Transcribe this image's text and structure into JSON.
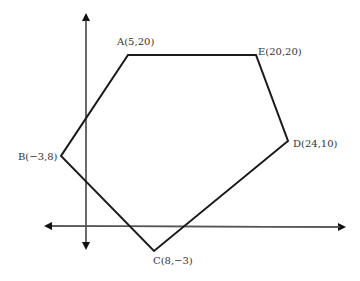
{
  "diagram": {
    "type": "coordinate-plane-polygon",
    "colors": {
      "axes": "#555555",
      "polygon": "#1a1a1a",
      "labels": "#333333"
    },
    "axes": {
      "x_axis": {
        "y": 226,
        "x_start": 44,
        "x_end": 346
      },
      "y_axis": {
        "x": 86,
        "y_start": 13,
        "y_end": 250
      }
    },
    "vertices": [
      {
        "name": "A",
        "coords": "(5,20)",
        "label": "A(5,20)",
        "px": 128,
        "py": 55
      },
      {
        "name": "E",
        "coords": "(20,20)",
        "label": "E(20,20)",
        "px": 256,
        "py": 55
      },
      {
        "name": "D",
        "coords": "(24,10)",
        "label": "D(24,10)",
        "px": 288,
        "py": 141
      },
      {
        "name": "C",
        "coords": "(8,−3)",
        "label": "C(8,−3)",
        "px": 154,
        "py": 251
      },
      {
        "name": "B",
        "coords": "(−3,8)",
        "label": "B(−3,8)",
        "px": 61,
        "py": 156
      }
    ]
  }
}
